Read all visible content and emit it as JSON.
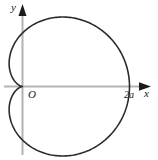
{
  "figure": {
    "type": "polar-curve-plot",
    "background_color": "#ffffff",
    "curve_color": "#2b2b2b",
    "axis_color": "#b3b3b3",
    "arrow_color": "#1a1a1a",
    "label_color": "#1a1a1a"
  },
  "labels": {
    "y_axis": "y",
    "x_axis": "x",
    "origin": "O",
    "x_intercept": "2a"
  },
  "chart_data": {
    "type": "line",
    "title": "",
    "subtitle": "",
    "xlabel": "x",
    "ylabel": "y",
    "curve_name": "cardioid",
    "equation": "r = a(1 + cos θ)",
    "grid": false,
    "legend": false,
    "origin_label": "O",
    "annotations": [
      {
        "text": "2a",
        "x": 2,
        "y": 0,
        "position": "below-right-of-point"
      },
      {
        "text": "O",
        "x": 0,
        "y": 0,
        "position": "below-right-of-origin"
      },
      {
        "text": "y",
        "x": 0,
        "y": 1.55,
        "position": "axis-tip-left"
      },
      {
        "text": "x",
        "x": 2.45,
        "y": 0,
        "position": "axis-tip-below"
      }
    ],
    "axes": {
      "x_axis_arrow": true,
      "y_axis_arrow": true,
      "xlim": [
        -0.3,
        2.45
      ],
      "ylim": [
        -1.5,
        1.6
      ],
      "ticks_shown": false,
      "tick_labels_x": [
        "2a"
      ],
      "tick_labels_y": []
    },
    "series": [
      {
        "name": "cardioid",
        "a": 1,
        "r_max": 2,
        "cusp": [
          0,
          0
        ],
        "x_intercept_right": 2,
        "x_leftmost": -0.25,
        "y_top": 1.3,
        "y_bottom": -1.3,
        "theta_range_deg": [
          0,
          360
        ],
        "points": [
          [
            2.0,
            0.0
          ],
          [
            1.93,
            0.36
          ],
          [
            1.74,
            0.68
          ],
          [
            1.45,
            0.93
          ],
          [
            1.12,
            1.1
          ],
          [
            0.77,
            1.2
          ],
          [
            0.44,
            1.24
          ],
          [
            0.16,
            1.19
          ],
          [
            -0.06,
            1.06
          ],
          [
            -0.19,
            0.87
          ],
          [
            -0.25,
            0.65
          ],
          [
            -0.24,
            0.42
          ],
          [
            -0.17,
            0.21
          ],
          [
            0.0,
            0.0
          ],
          [
            -0.17,
            -0.21
          ],
          [
            -0.24,
            -0.42
          ],
          [
            -0.25,
            -0.65
          ],
          [
            -0.19,
            -0.87
          ],
          [
            -0.06,
            -1.06
          ],
          [
            0.16,
            -1.19
          ],
          [
            0.44,
            -1.24
          ],
          [
            0.77,
            -1.2
          ],
          [
            1.12,
            -1.1
          ],
          [
            1.45,
            -0.93
          ],
          [
            1.74,
            -0.68
          ],
          [
            1.93,
            -0.36
          ],
          [
            2.0,
            0.0
          ]
        ]
      }
    ]
  }
}
